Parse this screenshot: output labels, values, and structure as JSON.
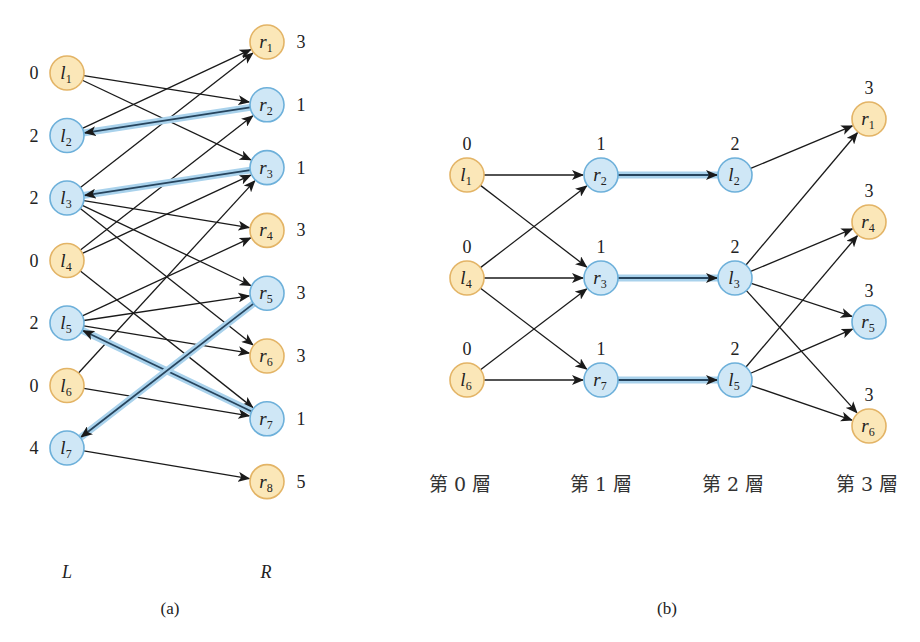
{
  "colors": {
    "free_fill": "#fbe7b8",
    "free_stroke": "#e3b466",
    "matched_fill": "#cfe7f6",
    "matched_stroke": "#6db0da",
    "edge": "#1a1a1a",
    "match_glow": "#a9d2ec",
    "match_core": "#27455e"
  },
  "panel_a": {
    "caption": "(a)",
    "left_label": "L",
    "right_label": "R",
    "left_nodes": [
      {
        "id": "l1",
        "base": "l",
        "sub": "1",
        "dist": "0",
        "matched": false
      },
      {
        "id": "l2",
        "base": "l",
        "sub": "2",
        "dist": "2",
        "matched": true
      },
      {
        "id": "l3",
        "base": "l",
        "sub": "3",
        "dist": "2",
        "matched": true
      },
      {
        "id": "l4",
        "base": "l",
        "sub": "4",
        "dist": "0",
        "matched": false
      },
      {
        "id": "l5",
        "base": "l",
        "sub": "5",
        "dist": "2",
        "matched": true
      },
      {
        "id": "l6",
        "base": "l",
        "sub": "6",
        "dist": "0",
        "matched": false
      },
      {
        "id": "l7",
        "base": "l",
        "sub": "7",
        "dist": "4",
        "matched": true
      }
    ],
    "right_nodes": [
      {
        "id": "r1",
        "base": "r",
        "sub": "1",
        "dist": "3",
        "matched": false
      },
      {
        "id": "r2",
        "base": "r",
        "sub": "2",
        "dist": "1",
        "matched": true
      },
      {
        "id": "r3",
        "base": "r",
        "sub": "3",
        "dist": "1",
        "matched": true
      },
      {
        "id": "r4",
        "base": "r",
        "sub": "4",
        "dist": "3",
        "matched": false
      },
      {
        "id": "r5",
        "base": "r",
        "sub": "5",
        "dist": "3",
        "matched": true
      },
      {
        "id": "r6",
        "base": "r",
        "sub": "6",
        "dist": "3",
        "matched": false
      },
      {
        "id": "r7",
        "base": "r",
        "sub": "7",
        "dist": "1",
        "matched": true
      },
      {
        "id": "r8",
        "base": "r",
        "sub": "8",
        "dist": "5",
        "matched": false
      }
    ],
    "edges": [
      {
        "from": "l1",
        "to": "r2"
      },
      {
        "from": "l1",
        "to": "r3"
      },
      {
        "from": "l2",
        "to": "r1"
      },
      {
        "from": "l3",
        "to": "r1"
      },
      {
        "from": "l3",
        "to": "r4"
      },
      {
        "from": "l3",
        "to": "r5"
      },
      {
        "from": "l3",
        "to": "r6"
      },
      {
        "from": "l4",
        "to": "r2"
      },
      {
        "from": "l4",
        "to": "r3"
      },
      {
        "from": "l4",
        "to": "r7"
      },
      {
        "from": "l5",
        "to": "r4"
      },
      {
        "from": "l5",
        "to": "r5"
      },
      {
        "from": "l5",
        "to": "r6"
      },
      {
        "from": "l6",
        "to": "r3"
      },
      {
        "from": "l6",
        "to": "r7"
      },
      {
        "from": "l7",
        "to": "r8"
      }
    ],
    "matching_edges": [
      {
        "from": "r2",
        "to": "l2"
      },
      {
        "from": "r3",
        "to": "l3"
      },
      {
        "from": "r7",
        "to": "l5"
      },
      {
        "from": "r5",
        "to": "l7"
      }
    ]
  },
  "panel_b": {
    "caption": "(b)",
    "layers": [
      {
        "label": "第 0 層",
        "nodes": [
          {
            "id": "l1",
            "base": "l",
            "sub": "1",
            "dist": "0",
            "matched": false
          },
          {
            "id": "l4",
            "base": "l",
            "sub": "4",
            "dist": "0",
            "matched": false
          },
          {
            "id": "l6",
            "base": "l",
            "sub": "6",
            "dist": "0",
            "matched": false
          }
        ]
      },
      {
        "label": "第 1 層",
        "nodes": [
          {
            "id": "r2",
            "base": "r",
            "sub": "2",
            "dist": "1",
            "matched": true
          },
          {
            "id": "r3",
            "base": "r",
            "sub": "3",
            "dist": "1",
            "matched": true
          },
          {
            "id": "r7",
            "base": "r",
            "sub": "7",
            "dist": "1",
            "matched": true
          }
        ]
      },
      {
        "label": "第 2 層",
        "nodes": [
          {
            "id": "l2",
            "base": "l",
            "sub": "2",
            "dist": "2",
            "matched": true
          },
          {
            "id": "l3",
            "base": "l",
            "sub": "3",
            "dist": "2",
            "matched": true
          },
          {
            "id": "l5",
            "base": "l",
            "sub": "5",
            "dist": "2",
            "matched": true
          }
        ]
      },
      {
        "label": "第 3 層",
        "nodes": [
          {
            "id": "r1",
            "base": "r",
            "sub": "1",
            "dist": "3",
            "matched": false
          },
          {
            "id": "r4",
            "base": "r",
            "sub": "4",
            "dist": "3",
            "matched": false
          },
          {
            "id": "r5",
            "base": "r",
            "sub": "5",
            "dist": "3",
            "matched": true
          },
          {
            "id": "r6",
            "base": "r",
            "sub": "6",
            "dist": "3",
            "matched": false
          }
        ]
      }
    ],
    "edges": [
      {
        "from": "l1",
        "to": "r2"
      },
      {
        "from": "l1",
        "to": "r3"
      },
      {
        "from": "l4",
        "to": "r2"
      },
      {
        "from": "l4",
        "to": "r3"
      },
      {
        "from": "l4",
        "to": "r7"
      },
      {
        "from": "l6",
        "to": "r3"
      },
      {
        "from": "l6",
        "to": "r7"
      },
      {
        "from": "l2",
        "to": "r1"
      },
      {
        "from": "l3",
        "to": "r1"
      },
      {
        "from": "l3",
        "to": "r4"
      },
      {
        "from": "l3",
        "to": "r5"
      },
      {
        "from": "l3",
        "to": "r6"
      },
      {
        "from": "l5",
        "to": "r4"
      },
      {
        "from": "l5",
        "to": "r5"
      },
      {
        "from": "l5",
        "to": "r6"
      }
    ],
    "matching_edges": [
      {
        "from": "r2",
        "to": "l2"
      },
      {
        "from": "r3",
        "to": "l3"
      },
      {
        "from": "r7",
        "to": "l5"
      }
    ]
  }
}
